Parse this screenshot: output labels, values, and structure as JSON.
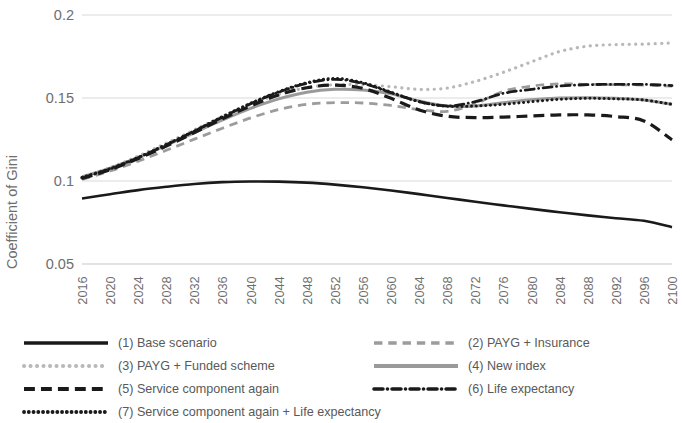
{
  "chart_data": {
    "type": "line",
    "title": "",
    "xlabel": "",
    "ylabel": "Coefficient of Gini",
    "xlim": [
      2016,
      2100
    ],
    "ylim": [
      0.05,
      0.2
    ],
    "yticks": [
      "0.05",
      "0.1",
      "0.15",
      "0.2"
    ],
    "ytick_values": [
      0.05,
      0.1,
      0.15,
      0.2
    ],
    "grid": "horizontal",
    "legend_position": "bottom",
    "x": [
      2016,
      2020,
      2024,
      2028,
      2032,
      2036,
      2040,
      2044,
      2048,
      2052,
      2056,
      2060,
      2064,
      2068,
      2072,
      2076,
      2080,
      2084,
      2088,
      2092,
      2096,
      2100
    ],
    "xtick_labels": [
      "2016",
      "2020",
      "2024",
      "2028",
      "2032",
      "2036",
      "2040",
      "2044",
      "2048",
      "2052",
      "2056",
      "2060",
      "2064",
      "2068",
      "2072",
      "2076",
      "2080",
      "2084",
      "2088",
      "2092",
      "2096",
      "2100"
    ],
    "series": [
      {
        "name": "(1) Base scenario",
        "key": "s1",
        "style": "solid",
        "color": "#1a1a1a",
        "width": 2.6,
        "values": [
          0.0895,
          0.092,
          0.0945,
          0.0965,
          0.0982,
          0.0993,
          0.0997,
          0.0996,
          0.099,
          0.0978,
          0.0962,
          0.0943,
          0.0921,
          0.0898,
          0.0875,
          0.0853,
          0.0832,
          0.0812,
          0.0793,
          0.0776,
          0.076,
          0.0722
        ]
      },
      {
        "name": "(2) PAYG + Insurance",
        "key": "s2",
        "style": "dashed",
        "color": "#9c9c9c",
        "width": 2.8,
        "values": [
          0.101,
          0.106,
          0.112,
          0.1185,
          0.1252,
          0.1318,
          0.138,
          0.143,
          0.1462,
          0.1472,
          0.147,
          0.1455,
          0.143,
          0.142,
          0.1465,
          0.154,
          0.1572,
          0.1585,
          0.1582,
          0.158,
          0.1578,
          0.1572
        ]
      },
      {
        "name": "(3) PAYG + Funded scheme",
        "key": "s3",
        "style": "dotted",
        "color": "#b8b8b8",
        "width": 3.2,
        "values": [
          0.102,
          0.108,
          0.115,
          0.1228,
          0.1308,
          0.1388,
          0.1462,
          0.1522,
          0.1562,
          0.158,
          0.158,
          0.1568,
          0.1552,
          0.156,
          0.16,
          0.1655,
          0.1718,
          0.178,
          0.1812,
          0.1822,
          0.1825,
          0.1832
        ]
      },
      {
        "name": "(4) New index",
        "key": "s4",
        "style": "solid",
        "color": "#9a9a9a",
        "width": 3.0,
        "values": [
          0.1025,
          0.1078,
          0.1142,
          0.1215,
          0.1292,
          0.1368,
          0.1438,
          0.1495,
          0.1535,
          0.1552,
          0.1548,
          0.1525,
          0.1482,
          0.1452,
          0.1452,
          0.1472,
          0.149,
          0.15,
          0.1502,
          0.1498,
          0.1488,
          0.1462
        ]
      },
      {
        "name": "(5) Service component again",
        "key": "s5",
        "style": "longdash",
        "color": "#1a1a1a",
        "width": 3.2,
        "values": [
          0.1015,
          0.1068,
          0.1135,
          0.121,
          0.1292,
          0.1375,
          0.1452,
          0.1518,
          0.1562,
          0.1578,
          0.1558,
          0.1498,
          0.1428,
          0.139,
          0.1382,
          0.1385,
          0.1392,
          0.1398,
          0.1398,
          0.1388,
          0.1362,
          0.1248
        ]
      },
      {
        "name": "(6) Life expectancy",
        "key": "s6",
        "style": "dashdot",
        "color": "#1a1a1a",
        "width": 2.8,
        "values": [
          0.1018,
          0.1072,
          0.114,
          0.1218,
          0.13,
          0.1385,
          0.1465,
          0.1535,
          0.1588,
          0.1612,
          0.1588,
          0.1532,
          0.1478,
          0.1452,
          0.1478,
          0.1528,
          0.1552,
          0.1572,
          0.158,
          0.1582,
          0.1582,
          0.1575
        ]
      },
      {
        "name": "(7) Service component again + Life expectancy",
        "key": "s7",
        "style": "densedot",
        "color": "#1a1a1a",
        "width": 3.0,
        "values": [
          0.1022,
          0.1075,
          0.1142,
          0.122,
          0.1302,
          0.1388,
          0.1468,
          0.1538,
          0.1592,
          0.1618,
          0.1592,
          0.1535,
          0.1478,
          0.145,
          0.1452,
          0.1462,
          0.1478,
          0.1492,
          0.1498,
          0.1495,
          0.1488,
          0.1462
        ]
      }
    ]
  },
  "legend": {
    "entries": [
      {
        "label": "(1) Base scenario",
        "key": "s1",
        "col": 0,
        "row": 0
      },
      {
        "label": "(2) PAYG + Insurance",
        "key": "s2",
        "col": 1,
        "row": 0
      },
      {
        "label": "(3) PAYG + Funded scheme",
        "key": "s3",
        "col": 0,
        "row": 1
      },
      {
        "label": "(4) New index",
        "key": "s4",
        "col": 1,
        "row": 1
      },
      {
        "label": "(5) Service component again",
        "key": "s5",
        "col": 0,
        "row": 2
      },
      {
        "label": "(6) Life expectancy",
        "key": "s6",
        "col": 1,
        "row": 2
      },
      {
        "label": "(7) Service component again + Life expectancy",
        "key": "s7",
        "col": 0,
        "row": 3
      }
    ]
  },
  "colors": {
    "grid": "#d9d9d9",
    "text": "#6e6e6e",
    "dark": "#1a1a1a",
    "gray": "#9a9a9a",
    "lightgray": "#b8b8b8"
  }
}
